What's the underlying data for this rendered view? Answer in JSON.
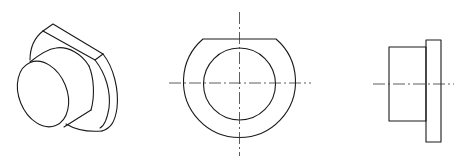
{
  "figure": {
    "description": "Three-view engineering drawing of a flanged cylindrical bushing with a flat-topped flange",
    "colors": {
      "background": "#ffffff",
      "line": "#1a1a1a",
      "centerline": "#333333"
    },
    "views": [
      {
        "id": "isometric",
        "label": "Isometric view"
      },
      {
        "id": "front",
        "label": "Front view"
      },
      {
        "id": "side",
        "label": "Side view"
      }
    ]
  }
}
